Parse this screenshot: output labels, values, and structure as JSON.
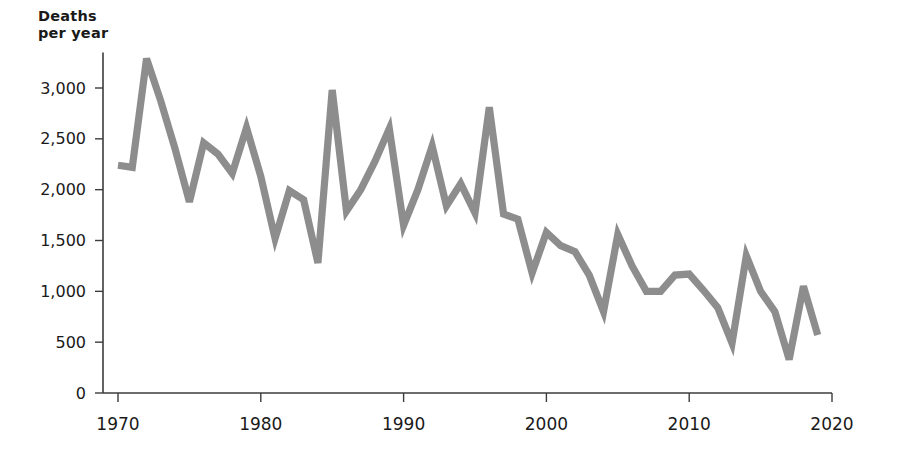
{
  "chart_data": {
    "type": "line",
    "title": "",
    "ylabel": "Deaths\nper year",
    "xlabel": "",
    "ylim": [
      0,
      3500
    ],
    "xlim": [
      1968.5,
      2021
    ],
    "grid": false,
    "legend": "none",
    "line_color": "#8d8d8d",
    "axis_color": "#3c3c3c",
    "y_ticks": [
      0,
      500,
      1000,
      1500,
      2000,
      2500,
      3000
    ],
    "y_tick_labels": [
      "0",
      "500",
      "1,000",
      "1,500",
      "2,000",
      "2,500",
      "3,000"
    ],
    "x_ticks": [
      1970,
      1980,
      1990,
      2000,
      2010,
      2020
    ],
    "x_tick_labels": [
      "1970",
      "1980",
      "1990",
      "2000",
      "2010",
      "2020"
    ],
    "x": [
      1970,
      1971,
      1972,
      1973,
      1974,
      1975,
      1976,
      1977,
      1978,
      1979,
      1980,
      1981,
      1982,
      1983,
      1984,
      1985,
      1986,
      1987,
      1988,
      1989,
      1990,
      1991,
      1992,
      1993,
      1994,
      1995,
      1996,
      1997,
      1998,
      1999,
      2000,
      2001,
      2002,
      2003,
      2004,
      2005,
      2006,
      2007,
      2008,
      2009,
      2010,
      2011,
      2012,
      2013,
      2014,
      2015,
      2016,
      2017,
      2018,
      2019
    ],
    "values": [
      2240,
      2220,
      3290,
      2870,
      2400,
      1880,
      2460,
      2350,
      2160,
      2610,
      2130,
      1520,
      1990,
      1900,
      1280,
      2980,
      1790,
      2000,
      2280,
      2600,
      1650,
      2000,
      2430,
      1840,
      2060,
      1770,
      2810,
      1760,
      1710,
      1180,
      1580,
      1450,
      1390,
      1160,
      800,
      1560,
      1250,
      1000,
      1000,
      1160,
      1170,
      1010,
      840,
      490,
      1350,
      1000,
      800,
      330,
      1050,
      570
    ]
  }
}
